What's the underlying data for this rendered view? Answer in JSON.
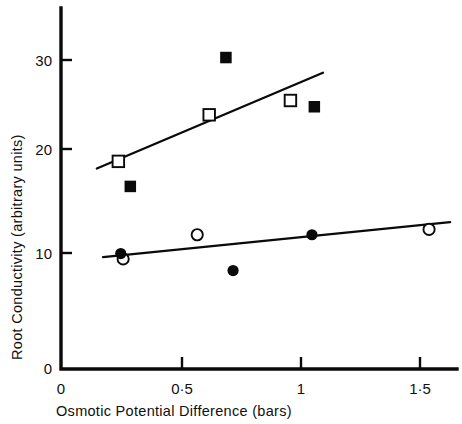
{
  "chart_data": {
    "type": "scatter",
    "title": "",
    "xlabel": "Osmotic Potential Difference (bars)",
    "ylabel": "Root Conductivity (arbitrary units)",
    "xlim": [
      0,
      1.63
    ],
    "ylim": [
      0,
      37
    ],
    "grid": false,
    "legend": "none",
    "xticks": [
      0,
      0.5,
      1,
      1.5
    ],
    "xtick_labels": [
      "0",
      "0·5",
      "1",
      "1·5"
    ],
    "yticks": [
      0,
      10,
      20,
      30
    ],
    "ytick_labels": [
      "0",
      "10",
      "20",
      "30"
    ],
    "series": [
      {
        "name": "open-square",
        "marker": "open square",
        "x": [
          0.24,
          0.62,
          0.96
        ],
        "y": [
          23.2,
          28.4,
          30.0
        ]
      },
      {
        "name": "filled-square",
        "marker": "filled square",
        "x": [
          0.29,
          0.69,
          1.06
        ],
        "y": [
          20.4,
          34.8,
          29.3
        ]
      },
      {
        "name": "open-circle",
        "marker": "open circle",
        "x": [
          0.26,
          0.57,
          1.54
        ],
        "y": [
          12.3,
          15.0,
          15.6
        ]
      },
      {
        "name": "filled-circle",
        "marker": "filled circle",
        "x": [
          0.25,
          0.72,
          1.05
        ],
        "y": [
          12.9,
          11.0,
          15.0
        ]
      }
    ],
    "fit_lines": [
      {
        "name": "upper-regression-line",
        "x": [
          0.15,
          1.096
        ],
        "y": [
          22.4,
          33.1
        ]
      },
      {
        "name": "lower-regression-line",
        "x": [
          0.176,
          1.628
        ],
        "y": [
          12.5,
          16.4
        ]
      }
    ]
  },
  "axes": {
    "x_label": "Osmotic Potential Difference (bars)",
    "y_label": "Root Conductivity (arbitrary units)",
    "origin_label": "0",
    "x_tick_labels": [
      "0",
      "0·5",
      "1",
      "1·5"
    ],
    "y_tick_labels": [
      "0",
      "10",
      "20",
      "30"
    ]
  }
}
